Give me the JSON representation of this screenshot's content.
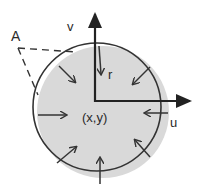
{
  "diagram": {
    "labels": {
      "A": "A",
      "v": "v",
      "r": "r",
      "u": "u",
      "center": "(x,y)"
    },
    "colors": {
      "background": "#ffffff",
      "disc_fill": "#d9d9d9",
      "stroke": "#333333",
      "axis": "#222222"
    },
    "circle": {
      "cx": 97,
      "cy": 107,
      "r": 64
    },
    "disc": {
      "cx": 103,
      "cy": 112,
      "r": 66
    },
    "axes": {
      "origin": [
        95,
        101
      ],
      "v_axis_tip": [
        95,
        12
      ],
      "u_axis_tip": [
        191,
        101
      ]
    },
    "inward_arrows": [
      {
        "name": "top",
        "from": [
          99,
          46
        ],
        "to": [
          101,
          74
        ]
      },
      {
        "name": "upper-left",
        "from": [
          59,
          66
        ],
        "to": [
          75,
          82
        ]
      },
      {
        "name": "upper-right",
        "from": [
          150,
          67
        ],
        "to": [
          133,
          84
        ]
      },
      {
        "name": "left",
        "from": [
          38,
          115
        ],
        "to": [
          66,
          115
        ]
      },
      {
        "name": "right",
        "from": [
          168,
          113
        ],
        "to": [
          145,
          113
        ]
      },
      {
        "name": "lower-left",
        "from": [
          57,
          163
        ],
        "to": [
          76,
          147
        ]
      },
      {
        "name": "lower-right",
        "from": [
          150,
          157
        ],
        "to": [
          135,
          140
        ]
      },
      {
        "name": "bottom",
        "from": [
          100,
          184
        ],
        "to": [
          100,
          158
        ]
      }
    ],
    "dashed_angle": {
      "vertex": [
        18,
        48
      ],
      "end1": [
        76,
        52
      ],
      "end2": [
        38,
        95
      ]
    }
  }
}
